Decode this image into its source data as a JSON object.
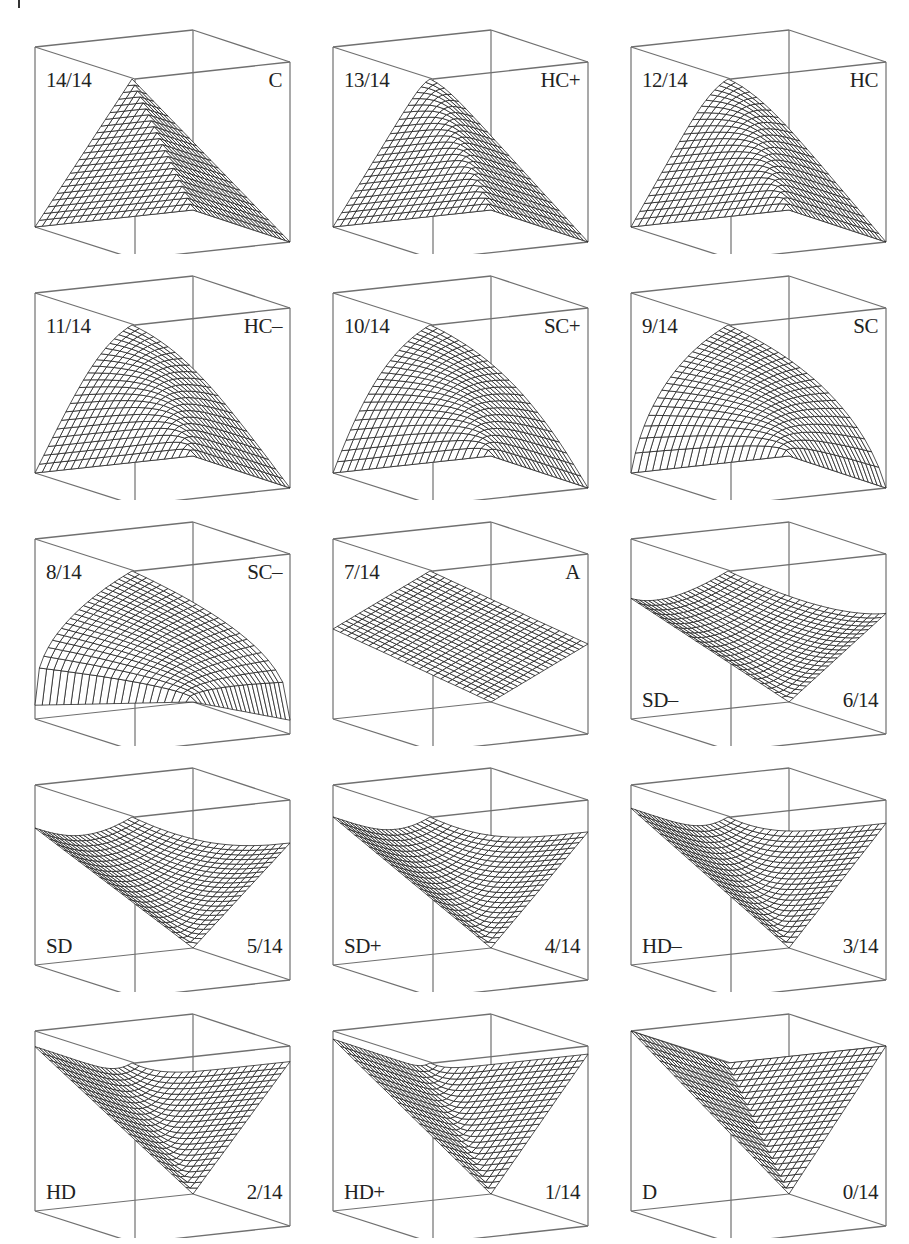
{
  "figure": {
    "panels": [
      {
        "fraction": "14/14",
        "name": "C",
        "orness_numerator": 14,
        "denominator": 14,
        "side": "conjunctive"
      },
      {
        "fraction": "13/14",
        "name": "HC+",
        "orness_numerator": 13,
        "denominator": 14,
        "side": "conjunctive"
      },
      {
        "fraction": "12/14",
        "name": "HC",
        "orness_numerator": 12,
        "denominator": 14,
        "side": "conjunctive"
      },
      {
        "fraction": "11/14",
        "name": "HC–",
        "orness_numerator": 11,
        "denominator": 14,
        "side": "conjunctive"
      },
      {
        "fraction": "10/14",
        "name": "SC+",
        "orness_numerator": 10,
        "denominator": 14,
        "side": "conjunctive"
      },
      {
        "fraction": "9/14",
        "name": "SC",
        "orness_numerator": 9,
        "denominator": 14,
        "side": "conjunctive"
      },
      {
        "fraction": "8/14",
        "name": "SC–",
        "orness_numerator": 8,
        "denominator": 14,
        "side": "conjunctive"
      },
      {
        "fraction": "7/14",
        "name": "A",
        "orness_numerator": 7,
        "denominator": 14,
        "side": "conjunctive"
      },
      {
        "fraction": "6/14",
        "name": "SD–",
        "orness_numerator": 6,
        "denominator": 14,
        "side": "disjunctive"
      },
      {
        "fraction": "5/14",
        "name": "SD",
        "orness_numerator": 5,
        "denominator": 14,
        "side": "disjunctive"
      },
      {
        "fraction": "4/14",
        "name": "SD+",
        "orness_numerator": 4,
        "denominator": 14,
        "side": "disjunctive"
      },
      {
        "fraction": "3/14",
        "name": "HD–",
        "orness_numerator": 3,
        "denominator": 14,
        "side": "disjunctive"
      },
      {
        "fraction": "2/14",
        "name": "HD",
        "orness_numerator": 2,
        "denominator": 14,
        "side": "disjunctive"
      },
      {
        "fraction": "1/14",
        "name": "HD+",
        "orness_numerator": 1,
        "denominator": 14,
        "side": "disjunctive"
      },
      {
        "fraction": "0/14",
        "name": "D",
        "orness_numerator": 0,
        "denominator": 14,
        "side": "disjunctive"
      }
    ],
    "colors": {
      "box": "#707070",
      "mesh": "#1a1a1a",
      "surface": "#ffffff",
      "text": "#222222"
    }
  }
}
